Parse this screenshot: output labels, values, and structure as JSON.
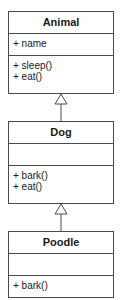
{
  "diagram": {
    "type": "uml-class-inheritance",
    "classes": [
      {
        "name": "Animal",
        "attributes": [
          "+ name"
        ],
        "methods": [
          "+ sleep()",
          "+ eat()"
        ]
      },
      {
        "name": "Dog",
        "attributes": [],
        "methods": [
          "+ bark()",
          "+ eat()"
        ]
      },
      {
        "name": "Poodle",
        "attributes": [],
        "methods": [
          "+ bark()"
        ]
      }
    ],
    "relations": [
      {
        "from": "Dog",
        "to": "Animal",
        "kind": "generalization"
      },
      {
        "from": "Poodle",
        "to": "Dog",
        "kind": "generalization"
      }
    ]
  }
}
